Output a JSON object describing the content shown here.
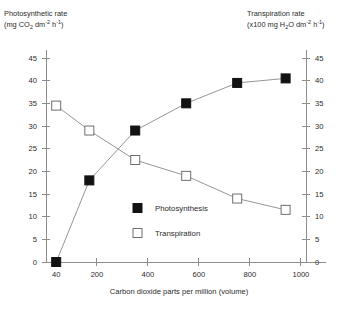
{
  "chart_data": {
    "type": "line",
    "title": "",
    "xlabel": "Carbon dioxide parts per million (volume)",
    "ylabel_left_line1": "Photosynthetic rate",
    "ylabel_left_line2_parts": {
      "prefix": "(mg CO",
      "sub1": "2",
      "mid": " dm",
      "sup1": "-2",
      "mid2": " h",
      "sup2": "-1",
      "suffix": ")"
    },
    "ylabel_right_line1": "Transpiration rate",
    "ylabel_right_line2_parts": {
      "prefix": "(x100 mg H",
      "sub1": "2",
      "mid": "O dm",
      "sup1": "-2",
      "mid2": " h",
      "sup2": "-1",
      "suffix": ")"
    },
    "x": [
      40,
      170,
      350,
      550,
      750,
      940
    ],
    "xlim": [
      0,
      1020
    ],
    "ylim": [
      0,
      45
    ],
    "xticks": [
      40,
      200,
      400,
      600,
      800,
      1000
    ],
    "xtick_labels": [
      "40",
      "200",
      "400",
      "600",
      "800",
      "1000"
    ],
    "yticks": [
      0,
      5,
      10,
      15,
      20,
      25,
      30,
      35,
      40,
      45
    ],
    "ytick_labels_left": [
      "0",
      "5",
      "10",
      "15",
      "20",
      "25",
      "30",
      "35",
      "40",
      "45"
    ],
    "ytick_labels_right": [
      "0",
      "5",
      "10",
      "15",
      "20",
      "25",
      "30",
      "35",
      "40",
      "45"
    ],
    "grid": false,
    "legend_position": "center",
    "series": [
      {
        "name": "Photosynthesis",
        "marker": "filled-square",
        "axis": "left",
        "values": [
          0,
          18,
          29,
          35,
          39.5,
          40.5
        ]
      },
      {
        "name": "Transpiration",
        "marker": "open-square",
        "axis": "right",
        "values": [
          34.5,
          29,
          22.5,
          19,
          14,
          11.5
        ]
      }
    ]
  },
  "legend": {
    "items": [
      {
        "label": "Photosynthesis",
        "marker": "filled-square"
      },
      {
        "label": "Transpiration",
        "marker": "open-square"
      }
    ]
  }
}
